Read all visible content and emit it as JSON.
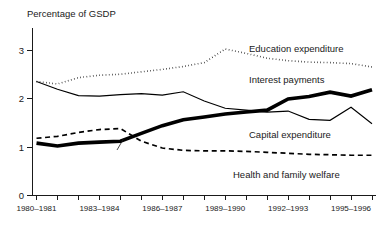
{
  "chart_data": {
    "type": "line",
    "title": "Percentage of GSDP",
    "xlabel": "",
    "ylabel": "Percentage of GSDP",
    "ylim": [
      0,
      3.35
    ],
    "yticks": [
      0,
      1,
      2,
      3
    ],
    "ytick_labels": [
      "0",
      "1",
      "2",
      "3"
    ],
    "grid": false,
    "legend_position": "inline-right",
    "x": [
      "1980-1981",
      "1981-1982",
      "1982-1983",
      "1983-1984",
      "1984-1985",
      "1985-1986",
      "1986-1987",
      "1987-1988",
      "1988-1989",
      "1989-1990",
      "1990-1991",
      "1991-1992",
      "1992-1993",
      "1993-1994",
      "1994-1995",
      "1995-1996",
      "1996-1997"
    ],
    "xtick_labels": [
      "1980–1981",
      "1983–1984",
      "1986–1987",
      "1989–1990",
      "1992–1993",
      "1995–1996"
    ],
    "xtick_label_indices": [
      0,
      3,
      6,
      9,
      12,
      15
    ],
    "series": [
      {
        "name": "Education expenditure",
        "style": "dotted",
        "values": [
          2.35,
          2.3,
          2.43,
          2.48,
          2.5,
          2.55,
          2.6,
          2.66,
          2.74,
          3.02,
          2.93,
          2.83,
          2.78,
          2.75,
          2.74,
          2.72,
          2.65
        ],
        "label": "Education expenditure",
        "label_x": 1996.6,
        "label_y": 3.02
      },
      {
        "name": "Interest payments",
        "style": "thick-solid",
        "values": [
          1.08,
          1.02,
          1.08,
          1.1,
          1.12,
          1.28,
          1.44,
          1.56,
          1.62,
          1.68,
          1.72,
          1.76,
          1.99,
          2.04,
          2.13,
          2.05,
          2.18
        ],
        "label": "Interest payments",
        "label_x": 1996.6,
        "label_y": 2.52
      },
      {
        "name": "Capital expenditure",
        "style": "thin-solid",
        "values": [
          2.35,
          2.19,
          2.06,
          2.05,
          2.08,
          2.1,
          2.07,
          2.14,
          1.95,
          1.8,
          1.76,
          1.72,
          1.74,
          1.57,
          1.55,
          1.82,
          1.48
        ],
        "label": "Capital expenditure",
        "label_x": 1996.6,
        "label_y": 1.36
      },
      {
        "name": "Health and family welfare",
        "style": "dashed",
        "values": [
          1.18,
          1.22,
          1.3,
          1.36,
          1.38,
          1.12,
          0.98,
          0.93,
          0.92,
          0.92,
          0.91,
          0.89,
          0.87,
          0.85,
          0.84,
          0.83,
          0.83
        ],
        "label": "Health and family welfare",
        "label_x": 1996.6,
        "label_y": 0.68
      }
    ],
    "colors": {
      "axis": "#1a1a1a",
      "series": "#000000",
      "background": "#ffffff"
    }
  }
}
